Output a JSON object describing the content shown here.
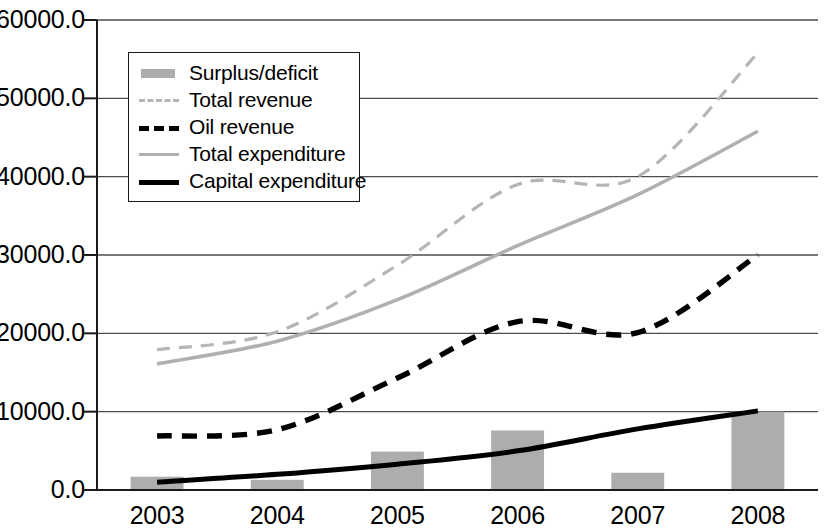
{
  "chart_data": {
    "type": "bar",
    "title": "",
    "subtitle": "",
    "xlabel": "",
    "ylabel": "",
    "categories": [
      "2003",
      "2004",
      "2005",
      "2006",
      "2007",
      "2008"
    ],
    "ylim": [
      0,
      60000
    ],
    "xlim_categories": 6,
    "ytick_labels": [
      "60000.0",
      "50000.0",
      "40000.0",
      "30000.0",
      "20000.0",
      "10000.0",
      "0.0"
    ],
    "ytick_values": [
      60000,
      50000,
      40000,
      30000,
      20000,
      10000,
      0
    ],
    "grid": "horizontal",
    "legend_position": "upper-left-inside",
    "series": [
      {
        "name": "Surplus/deficit",
        "type": "bar",
        "color": "#adadad",
        "values": [
          1700,
          1300,
          4900,
          7600,
          2200,
          10000
        ]
      },
      {
        "name": "Total revenue",
        "type": "line",
        "style": "dashed",
        "color": "#b5b5b5",
        "values": [
          17900,
          20200,
          28700,
          39000,
          40000,
          55800
        ]
      },
      {
        "name": "Oil revenue",
        "type": "line",
        "style": "dashed",
        "color": "#000000",
        "values": [
          6900,
          7700,
          14300,
          21500,
          20100,
          30000
        ]
      },
      {
        "name": "Total expenditure",
        "type": "line",
        "style": "solid",
        "color": "#b0b0b0",
        "values": [
          16100,
          19000,
          24300,
          31200,
          37700,
          45800
        ]
      },
      {
        "name": "Capital expenditure",
        "type": "line",
        "style": "solid",
        "color": "#000000",
        "values": [
          1000,
          2000,
          3300,
          5000,
          7800,
          10100
        ]
      }
    ]
  },
  "legend": {
    "items": [
      {
        "label": "Surplus/deficit",
        "swatch": "bar-swatch"
      },
      {
        "label": "Total revenue",
        "swatch": "dashed-light-line-swatch"
      },
      {
        "label": "Oil revenue",
        "swatch": "dashed-dark-line-swatch"
      },
      {
        "label": "Total expenditure",
        "swatch": "solid-light-line-swatch"
      },
      {
        "label": "Capital expenditure",
        "swatch": "solid-dark-line-swatch"
      }
    ]
  },
  "colors": {
    "bar_fill": "#adadad",
    "axis": "#1a1a1a",
    "gridline": "#4d4d4d",
    "light_series": "#b2b2b2",
    "dark_series": "#000000",
    "background": "#ffffff"
  }
}
